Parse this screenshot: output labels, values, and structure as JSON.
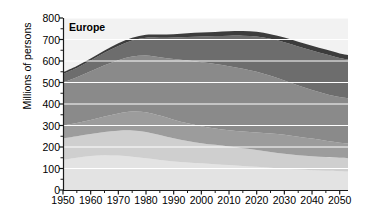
{
  "figure": {
    "panel_label": "Europe",
    "background_color": "#ffffff",
    "plot_background_color": "#f2f2f2"
  },
  "axes": {
    "y_axis_title": "Millions of persons",
    "y_ticks": [
      0,
      100,
      200,
      300,
      400,
      500,
      600,
      700,
      800
    ],
    "y_tick_labels": [
      "0",
      "100",
      "200",
      "300",
      "400",
      "500",
      "600",
      "700",
      "800"
    ],
    "y_min": 0,
    "y_max": 800,
    "x_ticks": [
      1950,
      1960,
      1970,
      1980,
      1990,
      2000,
      2010,
      2020,
      2030,
      2040,
      2050
    ],
    "x_tick_labels": [
      "1950",
      "1960",
      "1970",
      "1980",
      "1990",
      "2000",
      "2010",
      "2020",
      "2030",
      "2040",
      "2050"
    ],
    "x_minor_tick_step": 5,
    "x_min": 1950,
    "x_max": 2053,
    "gridlines": "horizontal-white"
  },
  "chart_data": {
    "type": "area",
    "title": "Europe",
    "xlabel": "",
    "ylabel": "Millions of persons",
    "ylim": [
      0,
      800
    ],
    "xlim": [
      1950,
      2053
    ],
    "grid": true,
    "legend": "none",
    "stacked": true,
    "x": [
      1950,
      1955,
      1960,
      1965,
      1970,
      1975,
      1980,
      1985,
      1990,
      1995,
      2000,
      2005,
      2010,
      2015,
      2020,
      2025,
      2030,
      2035,
      2040,
      2045,
      2050,
      2053
    ],
    "series": [
      {
        "name": "band-1-bottom",
        "color": "#e3e3e3",
        "values": [
          140,
          150,
          158,
          162,
          160,
          155,
          148,
          140,
          133,
          128,
          124,
          120,
          116,
          112,
          108,
          103,
          99,
          95,
          92,
          89,
          87,
          86
        ]
      },
      {
        "name": "band-2",
        "color": "#cfcfcf",
        "values": [
          100,
          100,
          102,
          108,
          116,
          122,
          122,
          116,
          108,
          100,
          94,
          90,
          86,
          82,
          78,
          74,
          70,
          67,
          65,
          64,
          63,
          62
        ]
      },
      {
        "name": "band-3",
        "color": "#9c9c9c",
        "values": [
          60,
          62,
          66,
          72,
          80,
          88,
          92,
          90,
          86,
          82,
          78,
          76,
          76,
          78,
          82,
          86,
          88,
          86,
          82,
          76,
          70,
          68
        ]
      },
      {
        "name": "band-4-main",
        "color": "#8a8a8a",
        "values": [
          200,
          212,
          226,
          238,
          248,
          256,
          264,
          272,
          282,
          292,
          298,
          300,
          298,
          292,
          282,
          268,
          252,
          238,
          226,
          218,
          212,
          210
        ]
      },
      {
        "name": "band-5",
        "color": "#6d6d6d",
        "values": [
          40,
          44,
          50,
          58,
          66,
          74,
          82,
          90,
          100,
          110,
          120,
          130,
          142,
          154,
          164,
          172,
          178,
          182,
          184,
          184,
          182,
          181
        ]
      },
      {
        "name": "band-6-top",
        "color": "#3c3c3c",
        "values": [
          8,
          9,
          10,
          11,
          12,
          13,
          14,
          15,
          16,
          17,
          18,
          19,
          20,
          21,
          22,
          22,
          22,
          22,
          22,
          22,
          21,
          21
        ]
      }
    ],
    "totals": [
      548,
      577,
      612,
      649,
      682,
      708,
      722,
      723,
      725,
      729,
      732,
      735,
      738,
      739,
      736,
      725,
      709,
      690,
      671,
      653,
      635,
      628
    ]
  }
}
